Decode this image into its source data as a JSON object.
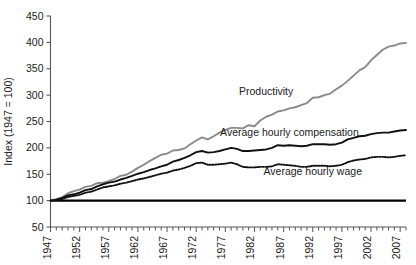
{
  "chart_data": {
    "type": "line",
    "title": "",
    "xlabel": "",
    "ylabel": "Index (1947 = 100)",
    "xlim": [
      1947,
      2008
    ],
    "ylim": [
      50,
      450
    ],
    "ytick_values": [
      50,
      100,
      150,
      200,
      250,
      300,
      350,
      400,
      450
    ],
    "ytick_labels": [
      "50",
      "100",
      "150",
      "200",
      "250",
      "300",
      "350",
      "400",
      "450"
    ],
    "xtick_values": [
      1947,
      1952,
      1957,
      1962,
      1967,
      1972,
      1977,
      1982,
      1987,
      1992,
      1997,
      2002,
      2007
    ],
    "xtick_labels": [
      "1947",
      "1952",
      "1957",
      "1962",
      "1967",
      "1972",
      "1977",
      "1982",
      "1987",
      "1992",
      "1997",
      "2002",
      "2007"
    ],
    "minor_xtick_interval": 1,
    "grid": false,
    "legend_position": "inline-annotations",
    "baseline": {
      "value": 100,
      "style": "solid-thick-black"
    },
    "x": [
      1947,
      1948,
      1949,
      1950,
      1951,
      1952,
      1953,
      1954,
      1955,
      1956,
      1957,
      1958,
      1959,
      1960,
      1961,
      1962,
      1963,
      1964,
      1965,
      1966,
      1967,
      1968,
      1969,
      1970,
      1971,
      1972,
      1973,
      1974,
      1975,
      1976,
      1977,
      1978,
      1979,
      1980,
      1981,
      1982,
      1983,
      1984,
      1985,
      1986,
      1987,
      1988,
      1989,
      1990,
      1991,
      1992,
      1993,
      1994,
      1995,
      1996,
      1997,
      1998,
      1999,
      2000,
      2001,
      2002,
      2003,
      2004,
      2005,
      2006,
      2007,
      2008
    ],
    "series": [
      {
        "name": "Productivity",
        "color": "#8a8a8a",
        "style": "solid",
        "label_x": 1984,
        "label_y": 300,
        "values": [
          100,
          103,
          106,
          114,
          118,
          121,
          126,
          128,
          133,
          134,
          137,
          141,
          147,
          149,
          155,
          162,
          168,
          175,
          181,
          187,
          189,
          195,
          196,
          199,
          207,
          214,
          220,
          216,
          222,
          229,
          234,
          238,
          238,
          237,
          243,
          241,
          252,
          259,
          263,
          269,
          271,
          275,
          277,
          281,
          285,
          295,
          296,
          300,
          303,
          311,
          318,
          327,
          337,
          347,
          353,
          366,
          376,
          386,
          392,
          394,
          398,
          399
        ]
      },
      {
        "name": "Average hourly compensation",
        "color": "#111111",
        "style": "solid",
        "label_x": 1988,
        "label_y": 222,
        "values": [
          100,
          102,
          105,
          110,
          112,
          115,
          120,
          122,
          127,
          131,
          134,
          136,
          140,
          143,
          147,
          151,
          154,
          158,
          161,
          165,
          168,
          174,
          177,
          181,
          186,
          192,
          194,
          191,
          192,
          194,
          197,
          200,
          198,
          194,
          194,
          195,
          196,
          197,
          200,
          205,
          204,
          205,
          204,
          203,
          204,
          207,
          207,
          207,
          206,
          207,
          210,
          216,
          219,
          222,
          223,
          226,
          228,
          229,
          229,
          231,
          233,
          234
        ]
      },
      {
        "name": "Average hourly wage",
        "color": "#111111",
        "style": "dotted",
        "label_x": 1992,
        "label_y": 148,
        "values": [
          100,
          101,
          103,
          107,
          109,
          111,
          115,
          117,
          121,
          125,
          127,
          129,
          132,
          134,
          137,
          140,
          142,
          145,
          148,
          151,
          153,
          157,
          159,
          162,
          166,
          171,
          172,
          168,
          168,
          169,
          170,
          172,
          169,
          164,
          163,
          163,
          164,
          164,
          165,
          169,
          168,
          167,
          166,
          164,
          164,
          166,
          166,
          166,
          165,
          166,
          168,
          173,
          176,
          178,
          179,
          182,
          183,
          183,
          182,
          183,
          185,
          186
        ]
      }
    ]
  },
  "annotations": {
    "productivity_label": "Productivity",
    "compensation_label": "Average hourly compensation",
    "wage_label": "Average hourly wage"
  }
}
